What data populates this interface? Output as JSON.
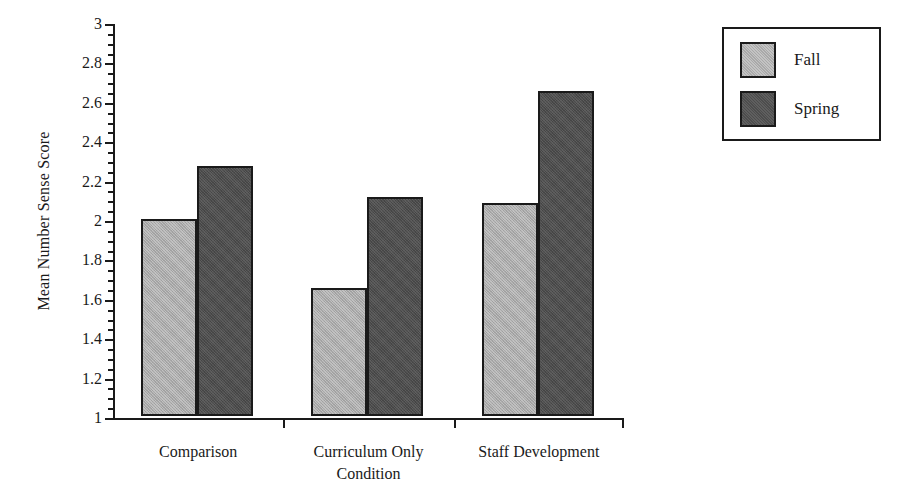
{
  "chart_data": {
    "type": "bar",
    "title": "",
    "subtitle": "",
    "xlabel": "Condition",
    "ylabel": "Mean Number Sense Score",
    "categories": [
      "Comparison",
      "Curriculum Only",
      "Staff Development"
    ],
    "series": [
      {
        "name": "Fall",
        "color": "#a9a9a9",
        "values": [
          2.0,
          1.65,
          2.08
        ]
      },
      {
        "name": "Spring",
        "color": "#4d4d4d",
        "values": [
          2.27,
          2.11,
          2.65
        ]
      }
    ],
    "ylim": [
      1,
      3
    ],
    "ytick_labels": [
      "1",
      "1.2",
      "1.4",
      "1.6",
      "1.8",
      "2",
      "2.2",
      "2.4",
      "2.6",
      "2.8",
      "3"
    ],
    "ytick_values": [
      1,
      1.2,
      1.4,
      1.6,
      1.8,
      2,
      2.2,
      2.4,
      2.6,
      2.8,
      3
    ],
    "yminor_step": 0.05,
    "grid": false,
    "legend_position": "outside-right-top",
    "legend_entries": [
      "Fall",
      "Spring"
    ],
    "xtick_style": "group-separators",
    "background_color": "#ffffff",
    "axis_color": "#1a1a1a"
  }
}
